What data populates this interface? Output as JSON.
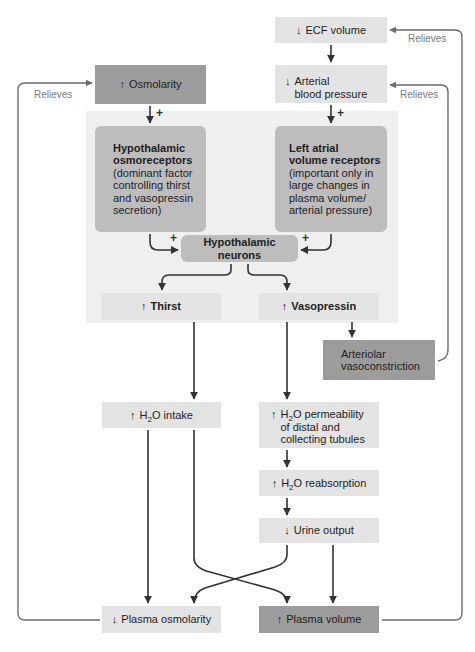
{
  "diagram": {
    "colors": {
      "panel": "#efefef",
      "light_box": "#e3e3e3",
      "mid_box": "#bdbdbd",
      "dark_box": "#9c9c9c",
      "arrow": "#3a3a3a",
      "feedback_line": "#6b6b6b",
      "relieves_text": "#7a7a7a"
    },
    "nodes": {
      "ecf_volume": {
        "arrow": "↓",
        "label": "ECF volume"
      },
      "arterial_bp": {
        "arrow": "↓",
        "line1": "Arterial",
        "line2": "blood pressure"
      },
      "osmolarity": {
        "arrow": "↑",
        "label": "Osmolarity"
      },
      "osmoreceptors": {
        "title1": "Hypothalamic",
        "title2": "osmoreceptors",
        "desc1": "(dominant factor",
        "desc2": "controlling thirst",
        "desc3": "and vasopressin",
        "desc4": "secretion)"
      },
      "atrial_receptors": {
        "title1": "Left atrial",
        "title2": "volume receptors",
        "desc1": "(important only in",
        "desc2": "large changes in",
        "desc3": "plasma volume/",
        "desc4": "arterial pressure)"
      },
      "hypothalamic_neurons": {
        "label": "Hypothalamic neurons"
      },
      "thirst": {
        "arrow": "↑",
        "label": "Thirst"
      },
      "vasopressin": {
        "arrow": "↑",
        "label": "Vasopressin"
      },
      "arteriolar": {
        "line1": "Arteriolar",
        "line2": "vasoconstriction"
      },
      "h2o_intake": {
        "arrow": "↑",
        "pre": "H",
        "sub": "2",
        "post": "O intake"
      },
      "h2o_permeability": {
        "arrow": "↑",
        "pre": "H",
        "sub": "2",
        "post": "O permeability",
        "line2": "of distal and",
        "line3": "collecting tubules"
      },
      "h2o_reabsorption": {
        "arrow": "↑",
        "pre": "H",
        "sub": "2",
        "post": "O reabsorption"
      },
      "urine_output": {
        "arrow": "↓",
        "label": "Urine output"
      },
      "plasma_osmolarity": {
        "arrow": "↓",
        "label": "Plasma osmolarity"
      },
      "plasma_volume": {
        "arrow": "↑",
        "label": "Plasma volume"
      }
    },
    "signs": {
      "plus": "+"
    },
    "feedback_labels": {
      "relieves_ecf": "Relieves",
      "relieves_bp": "Relieves",
      "relieves_osm": "Relieves"
    }
  }
}
